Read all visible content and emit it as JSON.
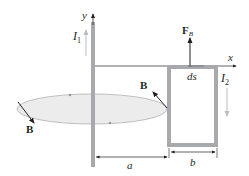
{
  "labels": {
    "y_axis": "y",
    "x_axis": "x",
    "current1": "I",
    "current1_sub": "1",
    "current2": "I",
    "current2_sub": "2",
    "force": "F",
    "force_sub": "B",
    "field_right": "B",
    "field_left": "B",
    "ds": "ds",
    "dist_a": "a",
    "dist_b": "b"
  },
  "colors": {
    "wire": "#a7a9ac",
    "loop": "#a7a9ac",
    "ellipse_fill": "#e6e7e8",
    "ellipse_stroke": "#bcbec0",
    "line": "#231f20",
    "arrow_light": "#bcbec0"
  }
}
